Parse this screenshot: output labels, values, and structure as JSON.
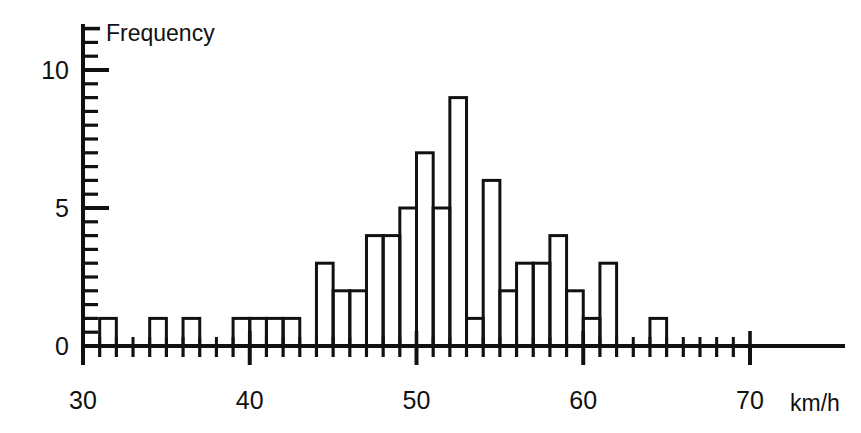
{
  "chart_data": {
    "type": "bar",
    "title": "",
    "subtitle": "",
    "ylabel": "Frequency",
    "xlabel": "km/h",
    "x_unit_label": "km/h",
    "grid": false,
    "legend": null,
    "xlim": [
      30,
      70
    ],
    "ylim": [
      0,
      11.5
    ],
    "x_major_ticks": [
      30,
      40,
      50,
      60,
      70
    ],
    "x_major_tick_labels": [
      "30",
      "40",
      "50",
      "60",
      "70"
    ],
    "x_minor_tick_step": 1,
    "y_major_ticks": [
      0,
      5,
      10
    ],
    "y_major_tick_labels": [
      "0",
      "5",
      "10"
    ],
    "y_minor_tick_step": 0.5,
    "bin_width": 1,
    "bin_starts": [
      31,
      34,
      36,
      39,
      40,
      41,
      42,
      44,
      45,
      46,
      47,
      48,
      49,
      50,
      51,
      52,
      53,
      54,
      55,
      56,
      57,
      58,
      59,
      60,
      61,
      64
    ],
    "categories": [
      "31-32",
      "34-35",
      "36-37",
      "39-40",
      "40-41",
      "41-42",
      "42-43",
      "44-45",
      "45-46",
      "46-47",
      "47-48",
      "48-49",
      "49-50",
      "50-51",
      "51-52",
      "52-53",
      "53-54",
      "54-55",
      "55-56",
      "56-57",
      "57-58",
      "58-59",
      "59-60",
      "60-61",
      "61-62",
      "64-65"
    ],
    "values": [
      1,
      1,
      1,
      1,
      1,
      1,
      1,
      3,
      2,
      2,
      4,
      4,
      5,
      7,
      5,
      9,
      1,
      6,
      2,
      3,
      3,
      4,
      2,
      1,
      3,
      1
    ]
  },
  "axes": {
    "y_axis_title": "Frequency",
    "x_axis_unit": "km/h"
  },
  "colors": {
    "ink": "#111111",
    "background": "#ffffff",
    "bar_fill": "none",
    "bar_stroke": "#111111"
  }
}
